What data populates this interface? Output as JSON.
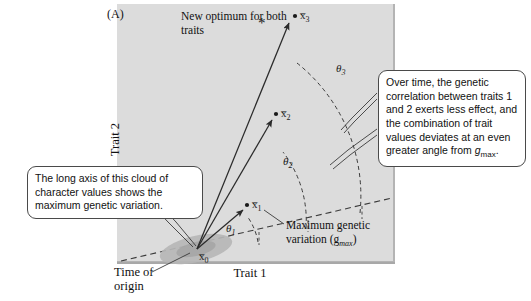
{
  "figure": {
    "panel_tag": "(A)",
    "axis_x_label": "Trait 1",
    "axis_y_label": "Trait 2",
    "panel_bg_color": "#dcdcdc"
  },
  "annotations": {
    "new_optimum": "New optimum for both traits",
    "max_genetic_variation": "Maximum genetic variation (g",
    "max_genetic_variation_sub": "max",
    "max_genetic_variation_tail": ")",
    "time_of_origin": "Time of origin"
  },
  "points": [
    {
      "id": "x0",
      "label": "x̅0",
      "base": "x̅",
      "sub": "0"
    },
    {
      "id": "x1",
      "label": "x̅1",
      "base": "x̅",
      "sub": "1"
    },
    {
      "id": "x2",
      "label": "x̅2",
      "base": "x̅",
      "sub": "2"
    },
    {
      "id": "x3",
      "label": "x̅3",
      "base": "x̅",
      "sub": "3"
    }
  ],
  "angles": [
    {
      "id": "theta1",
      "base": "θ",
      "sub": "1"
    },
    {
      "id": "theta2",
      "base": "θ",
      "sub": "2"
    },
    {
      "id": "theta3",
      "base": "θ",
      "sub": "3"
    }
  ],
  "callouts": {
    "left": "The long axis of this cloud of character values shows the maximum genetic variation.",
    "right_part1": "Over time, the genetic correlation between traits 1 and 2 exerts less effect, and the combination of trait values deviates at an even greater angle from ",
    "right_italic": "g",
    "right_sub": "max",
    "right_tail": "."
  }
}
